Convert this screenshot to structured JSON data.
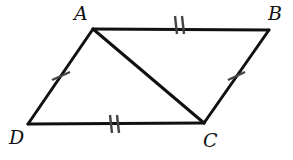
{
  "figure": {
    "kind": "geometry-diagram",
    "shape": "quadrilateral-with-diagonal",
    "background_color": "#ffffff",
    "stroke_color": "#111111",
    "tick_color": "#444444",
    "vertices": [
      {
        "name": "A",
        "label": "A",
        "x": 93,
        "y": 29,
        "label_x": 74,
        "label_y": 4
      },
      {
        "name": "B",
        "label": "B",
        "x": 269,
        "y": 30,
        "label_x": 268,
        "label_y": 4
      },
      {
        "name": "C",
        "label": "C",
        "x": 204,
        "y": 123,
        "label_x": 203,
        "label_y": 131
      },
      {
        "name": "D",
        "label": "D",
        "x": 28,
        "y": 124,
        "label_x": 9,
        "label_y": 128
      }
    ],
    "segments": [
      {
        "name": "AB",
        "from": "A",
        "to": "B",
        "x1": 93,
        "y1": 29,
        "x2": 269,
        "y2": 30,
        "width": 3,
        "ticks": 2
      },
      {
        "name": "BC",
        "from": "B",
        "to": "C",
        "x1": 269,
        "y1": 30,
        "x2": 204,
        "y2": 123,
        "width": 3,
        "ticks": 1
      },
      {
        "name": "DC",
        "from": "D",
        "to": "C",
        "x1": 28,
        "y1": 124,
        "x2": 204,
        "y2": 123,
        "width": 3,
        "ticks": 2
      },
      {
        "name": "AD",
        "from": "A",
        "to": "D",
        "x1": 93,
        "y1": 29,
        "x2": 28,
        "y2": 124,
        "width": 3,
        "ticks": 1
      },
      {
        "name": "AC",
        "from": "A",
        "to": "C",
        "x1": 93,
        "y1": 29,
        "x2": 204,
        "y2": 123,
        "width": 3,
        "ticks": 0
      }
    ],
    "tick_marks": [
      {
        "name": "tick-AB-1",
        "segment": "AB",
        "x1": 175,
        "y1": 16,
        "x2": 177,
        "y2": 34
      },
      {
        "name": "tick-AB-2",
        "segment": "AB",
        "x1": 182,
        "y1": 16,
        "x2": 184,
        "y2": 34
      },
      {
        "name": "tick-DC-1",
        "segment": "DC",
        "x1": 110,
        "y1": 115,
        "x2": 112,
        "y2": 133
      },
      {
        "name": "tick-DC-2",
        "segment": "DC",
        "x1": 117,
        "y1": 115,
        "x2": 119,
        "y2": 133
      },
      {
        "name": "tick-AD-1",
        "segment": "AD",
        "x1": 52,
        "y1": 80,
        "x2": 70,
        "y2": 72
      },
      {
        "name": "tick-BC-1",
        "segment": "BC",
        "x1": 228,
        "y1": 80,
        "x2": 245,
        "y2": 72
      }
    ]
  }
}
